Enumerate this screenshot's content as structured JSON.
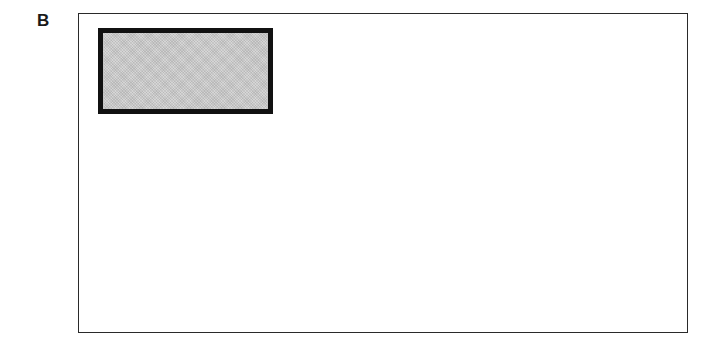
{
  "panel": {
    "label": "B"
  },
  "diagram": {
    "outer_box": {
      "border_color": "#2a2a2a",
      "fill": "#ffffff"
    },
    "inner_rect": {
      "border_color": "#111111",
      "fill": "#c8c8c8",
      "pattern": "stippled-gray"
    }
  }
}
